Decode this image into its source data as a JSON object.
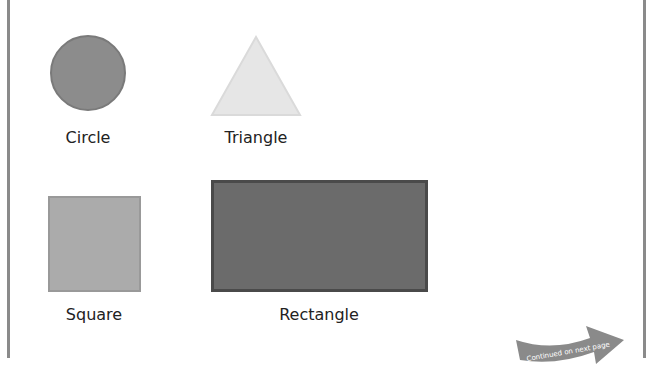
{
  "shapes": [
    {
      "name": "circle",
      "label": "Circle",
      "color": "#8c8c8c"
    },
    {
      "name": "triangle",
      "label": "Triangle",
      "color": "#e6e6e6"
    },
    {
      "name": "square",
      "label": "Square",
      "color": "#ababab"
    },
    {
      "name": "rectangle",
      "label": "Rectangle",
      "color": "#6b6b6b"
    }
  ],
  "continued": {
    "text": "Continued on next page",
    "icon": "curved-arrow-right-icon"
  }
}
